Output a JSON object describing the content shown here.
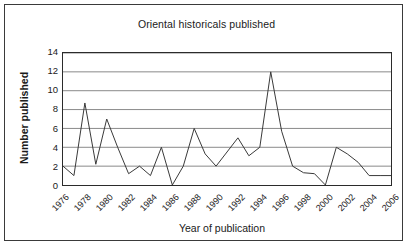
{
  "chart_data": {
    "type": "line",
    "title": "Oriental historicals published",
    "xlabel": "Year of publication",
    "ylabel": "Number published",
    "x": [
      1976,
      1977,
      1978,
      1979,
      1980,
      1981,
      1982,
      1983,
      1984,
      1985,
      1986,
      1987,
      1988,
      1989,
      1990,
      1991,
      1992,
      1993,
      1994,
      1995,
      1996,
      1997,
      1998,
      1999,
      2000,
      2001,
      2002,
      2003,
      2004,
      2005,
      2006
    ],
    "values": [
      2,
      1,
      8.7,
      2.2,
      7,
      4,
      1.2,
      2,
      1,
      4,
      0,
      2,
      6,
      3.3,
      2,
      3.5,
      5,
      3.1,
      4,
      12,
      5.7,
      2,
      1.3,
      1.2,
      0,
      4,
      3.3,
      2.4,
      1,
      1,
      1
    ],
    "series": [
      {
        "name": "Number published",
        "values": [
          2,
          1,
          8.7,
          2.2,
          7,
          4,
          1.2,
          2,
          1,
          4,
          0,
          2,
          6,
          3.3,
          2,
          3.5,
          5,
          3.1,
          4,
          12,
          5.7,
          2,
          1.3,
          1.2,
          0,
          4,
          3.3,
          2.4,
          1,
          1,
          1
        ]
      }
    ],
    "xtick_labels": [
      "1976",
      "1978",
      "1980",
      "1982",
      "1984",
      "1986",
      "1988",
      "1990",
      "1992",
      "1994",
      "1996",
      "1998",
      "2000",
      "2002",
      "2004",
      "2006"
    ],
    "xtick_values": [
      1976,
      1978,
      1980,
      1982,
      1984,
      1986,
      1988,
      1990,
      1992,
      1994,
      1996,
      1998,
      2000,
      2002,
      2004,
      2006
    ],
    "ytick_labels": [
      "0",
      "2",
      "4",
      "6",
      "8",
      "10",
      "12",
      "14"
    ],
    "ytick_values": [
      0,
      2,
      4,
      6,
      8,
      10,
      12,
      14
    ],
    "xlim": [
      1976,
      2006
    ],
    "ylim": [
      0,
      14
    ],
    "grid": "horizontal",
    "legend": "none",
    "line_color": "#3a3a3a",
    "grid_color": "#8a8a8a",
    "axis_color": "#2b2b2b",
    "background_color": "#ffffff"
  }
}
